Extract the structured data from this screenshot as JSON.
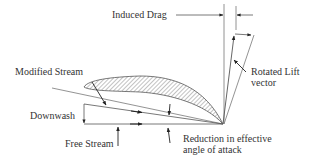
{
  "diagram": {
    "type": "aerodynamics-vector-diagram",
    "labels": {
      "induced_drag": "Induced Drag",
      "rotated_lift_line1": "Rotated Lift",
      "rotated_lift_line2": "vector",
      "modified_stream": "Modified Stream",
      "downwash": "Downwash",
      "free_stream": "Free Stream",
      "reduction_line1": "Reduction in effective",
      "reduction_line2": "angle of attack"
    },
    "colors": {
      "line": "#555555",
      "text": "#333333",
      "hatch": "#666666",
      "background": "#ffffff"
    }
  }
}
